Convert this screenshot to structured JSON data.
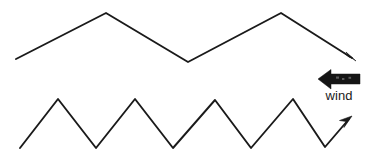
{
  "figure": {
    "background_color": "#ffffff",
    "stroke_color": "#1a1a1a",
    "wind_arrow_color": "#151515",
    "title": "",
    "waves": [
      {
        "name": "upper-wave",
        "description": "long-wavelength zigzag wave with two peaks",
        "peaks": 2,
        "points": "16,59 106,13 188,62 281,13 352,58",
        "arrow_direction": "down-right",
        "arrow_tip": "356,61",
        "arrow_head_polygon": "356,61 344,53 349,58 346,53"
      },
      {
        "name": "lower-wave",
        "description": "short-wavelength zigzag wave with four peaks",
        "peaks": 4,
        "points": "20,148 58,99 96,148 135,99 173,148 215,100 251,148 293,99 325,147 349,119",
        "arrow_direction": "up-right",
        "arrow_tip": "351,117",
        "arrow_head_polygon": "351,117 340,121 346,122 344,127"
      }
    ],
    "wind_indicator": {
      "name": "wind-arrow",
      "label": "wind",
      "direction": "left",
      "arrow_tip_x": 318,
      "arrow_tip_y": 79,
      "arrow_tail_x": 360,
      "arrow_body_top": 74,
      "arrow_body_bottom": 84,
      "arrow_head_top": 69,
      "arrow_head_bottom": 89,
      "arrow_head_x": 331,
      "label_x": 339,
      "label_y": 100
    }
  }
}
